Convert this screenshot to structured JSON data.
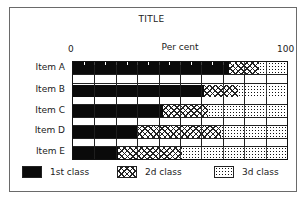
{
  "chart_data": {
    "type": "bar",
    "orientation": "horizontal",
    "stacked": true,
    "title": "TITLE",
    "xlabel": "Per cent",
    "ylabel": "",
    "xlim": [
      0,
      100
    ],
    "x_ticks": [
      "0",
      "100"
    ],
    "grid": true,
    "legend_position": "bottom",
    "categories": [
      "Item A",
      "Item B",
      "Item C",
      "Item D",
      "Item E"
    ],
    "series": [
      {
        "name": "1st class",
        "pattern": "solid-black",
        "values": [
          73,
          61,
          42,
          30,
          21
        ]
      },
      {
        "name": "2d class",
        "pattern": "crosshatch",
        "values": [
          14,
          16,
          21,
          39,
          30
        ]
      },
      {
        "name": "3d class",
        "pattern": "dotted",
        "values": [
          13,
          23,
          37,
          31,
          49
        ]
      }
    ]
  },
  "title": "TITLE",
  "axis": {
    "label": "Per cent",
    "min_label": "0",
    "max_label": "100"
  },
  "rows": [
    {
      "label": "Item A"
    },
    {
      "label": "Item B"
    },
    {
      "label": "Item C"
    },
    {
      "label": "Item D"
    },
    {
      "label": "Item E"
    }
  ],
  "legend": [
    {
      "label": "1st class"
    },
    {
      "label": "2d class"
    },
    {
      "label": "3d class"
    }
  ]
}
